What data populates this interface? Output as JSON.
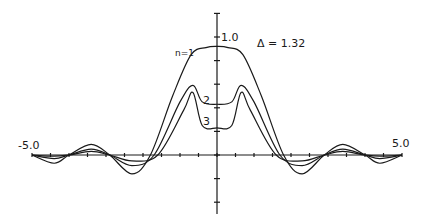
{
  "chart_data": {
    "type": "line",
    "title": "",
    "annotation": "Δ = 1.32",
    "xlabel": "",
    "ylabel": "",
    "xlim": [
      -5.0,
      5.0
    ],
    "ylim": [
      -0.5,
      1.2
    ],
    "x_tick_labels": [
      "-5.0",
      "5.0"
    ],
    "x_tick_step": 0.5,
    "y_tick_labels": [
      "1.0"
    ],
    "y_tick_step": 0.2,
    "grid": false,
    "legend": "inline labels",
    "series": [
      {
        "name": "n=1",
        "label": "n=1",
        "points": [
          [
            -5.0,
            0.0
          ],
          [
            -4.4,
            -0.07
          ],
          [
            -4.0,
            0.0
          ],
          [
            -3.4,
            0.09
          ],
          [
            -2.9,
            0.0
          ],
          [
            -2.3,
            -0.16
          ],
          [
            -1.8,
            0.0
          ],
          [
            -1.2,
            0.5
          ],
          [
            -0.7,
            0.85
          ],
          [
            -0.3,
            0.91
          ],
          [
            0,
            0.92
          ],
          [
            0.3,
            0.91
          ],
          [
            0.7,
            0.85
          ],
          [
            1.2,
            0.5
          ],
          [
            1.8,
            0.0
          ],
          [
            2.3,
            -0.16
          ],
          [
            2.9,
            0.0
          ],
          [
            3.4,
            0.09
          ],
          [
            4.0,
            0.0
          ],
          [
            4.4,
            -0.07
          ],
          [
            5.0,
            0.0
          ]
        ]
      },
      {
        "name": "n=2",
        "label": "2",
        "points": [
          [
            -5.0,
            0.0
          ],
          [
            -4.4,
            -0.03
          ],
          [
            -4.0,
            0.0
          ],
          [
            -3.4,
            0.05
          ],
          [
            -2.9,
            0.0
          ],
          [
            -2.3,
            -0.09
          ],
          [
            -1.7,
            0.0
          ],
          [
            -1.0,
            0.45
          ],
          [
            -0.65,
            0.59
          ],
          [
            -0.4,
            0.45
          ],
          [
            0,
            0.43
          ],
          [
            0.4,
            0.45
          ],
          [
            0.65,
            0.59
          ],
          [
            1.0,
            0.45
          ],
          [
            1.7,
            0.0
          ],
          [
            2.3,
            -0.09
          ],
          [
            2.9,
            0.0
          ],
          [
            3.4,
            0.05
          ],
          [
            4.0,
            0.0
          ],
          [
            4.4,
            -0.03
          ],
          [
            5.0,
            0.0
          ]
        ]
      },
      {
        "name": "n=3",
        "label": "3",
        "points": [
          [
            -5.0,
            0.0
          ],
          [
            -4.4,
            -0.01
          ],
          [
            -4.0,
            0.0
          ],
          [
            -3.4,
            0.03
          ],
          [
            -2.9,
            0.0
          ],
          [
            -2.3,
            -0.05
          ],
          [
            -1.6,
            0.0
          ],
          [
            -0.9,
            0.38
          ],
          [
            -0.65,
            0.53
          ],
          [
            -0.4,
            0.25
          ],
          [
            0,
            0.23
          ],
          [
            0.4,
            0.25
          ],
          [
            0.65,
            0.53
          ],
          [
            0.9,
            0.38
          ],
          [
            1.6,
            0.0
          ],
          [
            2.3,
            -0.05
          ],
          [
            2.9,
            0.0
          ],
          [
            3.4,
            0.03
          ],
          [
            4.0,
            0.0
          ],
          [
            4.4,
            -0.01
          ],
          [
            5.0,
            0.0
          ]
        ]
      }
    ]
  },
  "labels": {
    "x_min": "-5.0",
    "x_max": "5.0",
    "y_one": "1.0",
    "delta": "Δ = 1.32",
    "n1": "n=1",
    "n2": "2",
    "n3": "3"
  },
  "colors": {
    "ink": "#1a1a1a",
    "background": "#ffffff"
  }
}
